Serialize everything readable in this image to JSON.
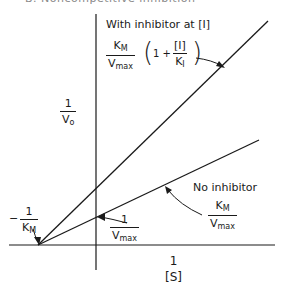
{
  "title": "B. Noncompetitive inhibition",
  "y_axis": {
    "numerator": "1",
    "denominator": "V",
    "denominator_sub": "o"
  },
  "x_axis": {
    "numerator": "1",
    "denominator": "[S]"
  },
  "with_inhibitor": {
    "label": "With inhibitor at [I]",
    "slope": {
      "num": "K",
      "num_sub": "M",
      "den": "V",
      "den_sub": "max"
    },
    "factor": {
      "open": "(",
      "one_plus": "1 +",
      "num": "[I]",
      "den": "K",
      "den_sub": "I",
      "close": ")"
    }
  },
  "no_inhibitor": {
    "label": "No inhibitor",
    "slope": {
      "num": "K",
      "num_sub": "M",
      "den": "V",
      "den_sub": "max"
    }
  },
  "x_intercept": {
    "sign": "−",
    "num": "1",
    "den": "K",
    "den_sub": "M"
  },
  "y_intercept": {
    "num": "1",
    "den": "V",
    "den_sub": "max"
  },
  "colors": {
    "ink": "#1a1a1a",
    "background": "#ffffff"
  }
}
